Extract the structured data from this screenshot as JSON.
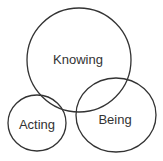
{
  "diagram": {
    "type": "venn",
    "stroke_color": "#333333",
    "text_color": "#333333",
    "background": "#ffffff",
    "sets": [
      {
        "id": "knowing",
        "label": "Knowing",
        "cx": 79,
        "cy": 60,
        "rx": 52,
        "ry": 52
      },
      {
        "id": "acting",
        "label": "Acting",
        "cx": 37,
        "cy": 123,
        "rx": 29,
        "ry": 28
      },
      {
        "id": "being",
        "label": "Being",
        "cx": 116,
        "cy": 115,
        "rx": 40,
        "ry": 37
      }
    ]
  }
}
